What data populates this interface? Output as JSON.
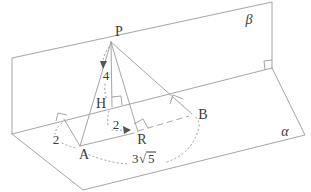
{
  "figure": {
    "type": "solid-geometry-diagram",
    "planes": {
      "alpha_label": "α",
      "beta_label": "β"
    },
    "points": {
      "P": "P",
      "A": "A",
      "B": "B",
      "H": "H",
      "R": "R"
    },
    "measurements": {
      "PH": "4",
      "A_to_edge": "2",
      "HR": "2",
      "AB": {
        "text": "3√5",
        "coefficient": "3",
        "radical_symbol": "√",
        "radicand": "5"
      }
    },
    "colors": {
      "line": "#9a9a9a",
      "label": "#3a3a3a",
      "background": "#ffffff"
    }
  }
}
